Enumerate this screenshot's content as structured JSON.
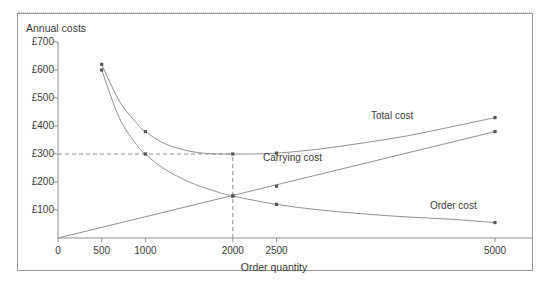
{
  "figure": {
    "top_faint_text": "",
    "y_axis_title": "Annual costs",
    "x_axis_title": "Order quantity",
    "frame_color": "#9a9a9a",
    "line_color": "#8f8f8f",
    "marker_color": "#555555",
    "guide_color": "#8f8f8f",
    "text_color": "#3a3a3a"
  },
  "chart_data": {
    "type": "line",
    "title": "",
    "subtitle": "",
    "xlabel": "Order quantity",
    "ylabel": "Annual costs",
    "xlim": [
      0,
      5400
    ],
    "ylim": [
      0,
      700
    ],
    "grid": false,
    "legend_position": "inline-annotations",
    "x_ticks": [
      0,
      500,
      1000,
      2000,
      2500,
      5000
    ],
    "x_tick_labels": [
      "0",
      "500",
      "1000",
      "2000",
      "2500",
      "5000"
    ],
    "y_ticks": [
      100,
      200,
      300,
      400,
      500,
      600,
      700
    ],
    "y_tick_labels": [
      "£100",
      "£200",
      "£300",
      "£400",
      "£500",
      "£600",
      "£700"
    ],
    "series": [
      {
        "name": "Total cost",
        "label": "Total cost",
        "marker_x": [
          500,
          1000,
          2000,
          2500,
          5000
        ],
        "marker_y": [
          620,
          380,
          300,
          303,
          430
        ],
        "x": [
          500,
          700,
          900,
          1000,
          1200,
          1400,
          1600,
          1800,
          2000,
          2200,
          2500,
          3000,
          3500,
          4000,
          4500,
          5000
        ],
        "y": [
          620,
          490,
          410,
          380,
          340,
          318,
          305,
          300,
          300,
          300,
          303,
          318,
          340,
          365,
          397,
          430
        ]
      },
      {
        "name": "Carrying cost",
        "label": "Carrying cost",
        "marker_x": [
          2000,
          2500,
          5000
        ],
        "marker_y": [
          150,
          185,
          380
        ],
        "x": [
          0,
          5000
        ],
        "y": [
          0,
          380
        ]
      },
      {
        "name": "Order cost",
        "label": "Order cost",
        "marker_x": [
          500,
          1000,
          2000,
          2500,
          5000
        ],
        "marker_y": [
          600,
          300,
          150,
          120,
          55
        ],
        "x": [
          500,
          700,
          900,
          1000,
          1200,
          1500,
          1800,
          2000,
          2500,
          3000,
          3500,
          4000,
          4500,
          5000
        ],
        "y": [
          600,
          430,
          333,
          300,
          250,
          200,
          167,
          150,
          120,
          100,
          86,
          75,
          67,
          55
        ]
      }
    ],
    "annotations": [
      {
        "name": "eoq-horizontal-guide",
        "type": "dashed-horizontal",
        "y": 300,
        "x_from": 0,
        "x_to": 2000
      },
      {
        "name": "eoq-vertical-guide",
        "type": "dashed-vertical",
        "x": 2000,
        "y_from": 0,
        "y_to": 300
      }
    ],
    "eoq": {
      "quantity": 2000,
      "total_cost": 300,
      "intersection_cost": 150
    }
  }
}
